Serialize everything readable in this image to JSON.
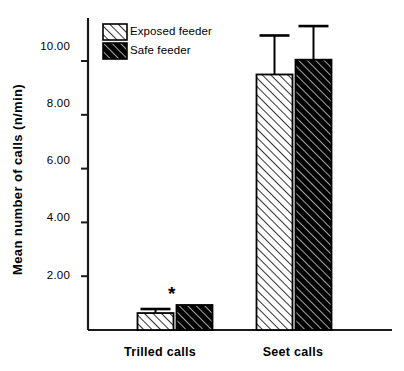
{
  "chart_data": {
    "type": "bar",
    "title": "",
    "subtitle": "",
    "xlabel": "",
    "ylabel": "Mean number of calls (n/min)",
    "categories": [
      "Trilled calls",
      "Seet calls"
    ],
    "series": [
      {
        "name": "Exposed feeder",
        "values": [
          0.63,
          9.5
        ],
        "errors": [
          0.15,
          1.45
        ],
        "fill": "#ffffff",
        "hatch": "/"
      },
      {
        "name": "Safe feeder",
        "values": [
          0.93,
          10.05
        ],
        "errors": [
          0.0,
          1.25
        ],
        "fill": "#000000",
        "hatch": "/"
      }
    ],
    "ylim": [
      0,
      11.6
    ],
    "ytick_values": [
      2.0,
      4.0,
      6.0,
      8.0,
      10.0
    ],
    "ytick_labels": [
      "2.00",
      "4.00",
      "6.00",
      "8.00",
      "10.00"
    ],
    "grid": false,
    "legend_position": "top-left",
    "annotations": [
      {
        "text": "*",
        "category": "Trilled calls",
        "series": "Safe feeder",
        "meaning": "significant-difference"
      }
    ],
    "axis_color": "#1a1a1a"
  },
  "legend": {
    "items": [
      {
        "label": "Exposed feeder"
      },
      {
        "label": "Safe feeder"
      }
    ]
  },
  "axes": {
    "y_title": "Mean number of calls (n/min)",
    "tick_labels": [
      "10.00",
      "8.00",
      "6.00",
      "4.00",
      "2.00"
    ],
    "category_labels": [
      "Trilled calls",
      "Seet calls"
    ]
  },
  "annotation": {
    "asterisk": "*"
  }
}
